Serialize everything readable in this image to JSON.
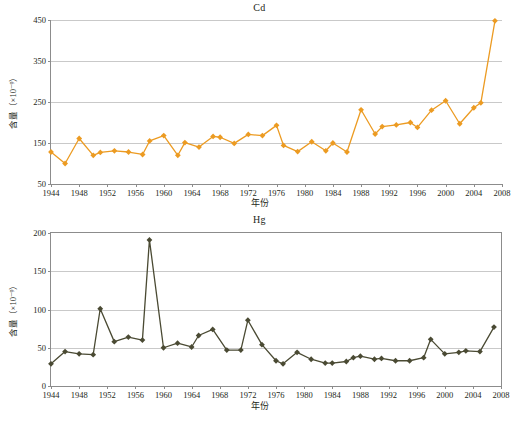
{
  "figure": {
    "panels": [
      "cd",
      "hg"
    ],
    "x_axis_title": "年份",
    "y_axis_title": "含量（×10⁻⁹）"
  },
  "chart_data": [
    {
      "type": "line",
      "title": "Cd",
      "xlabel": "年份",
      "ylabel": "含量（×10⁻⁹）",
      "xlim": [
        1944,
        2008
      ],
      "ylim": [
        50,
        450
      ],
      "xticks": [
        1944,
        1948,
        1952,
        1956,
        1960,
        1964,
        1968,
        1972,
        1976,
        1980,
        1984,
        1988,
        1992,
        1996,
        2000,
        2004,
        2008
      ],
      "yticks": [
        50,
        150,
        250,
        350,
        450
      ],
      "grid": true,
      "legend": "none",
      "color": "#EC9B22",
      "marker": "diamond",
      "x": [
        1944,
        1946,
        1948,
        1950,
        1952,
        1954,
        1956,
        1958,
        1960,
        1962,
        1964,
        1966,
        1968,
        1970,
        1972,
        1974,
        1976,
        1978,
        1980,
        1982,
        1984,
        1986,
        1988,
        1990,
        1992,
        1994,
        1996,
        1998,
        2000,
        2002,
        2004,
        2006
      ],
      "values": [
        128,
        100,
        161,
        120,
        127,
        131,
        128,
        155,
        168,
        120,
        151,
        140,
        166,
        164,
        149,
        171,
        168,
        193,
        144,
        129,
        153,
        140,
        150,
        128,
        231,
        172,
        190,
        194,
        200,
        188,
        230,
        253,
        197,
        236,
        248,
        448
      ],
      "series": [
        {
          "name": "Cd",
          "points": [
            {
              "year": 1944,
              "value": 128
            },
            {
              "year": 1946,
              "value": 100
            },
            {
              "year": 1948,
              "value": 161
            },
            {
              "year": 1950,
              "value": 120
            },
            {
              "year": 1951,
              "value": 127
            },
            {
              "year": 1953,
              "value": 131
            },
            {
              "year": 1955,
              "value": 128
            },
            {
              "year": 1957,
              "value": 122
            },
            {
              "year": 1958,
              "value": 155
            },
            {
              "year": 1960,
              "value": 168
            },
            {
              "year": 1962,
              "value": 120
            },
            {
              "year": 1963,
              "value": 151
            },
            {
              "year": 1965,
              "value": 140
            },
            {
              "year": 1967,
              "value": 166
            },
            {
              "year": 1968,
              "value": 164
            },
            {
              "year": 1970,
              "value": 149
            },
            {
              "year": 1972,
              "value": 171
            },
            {
              "year": 1974,
              "value": 168
            },
            {
              "year": 1976,
              "value": 193
            },
            {
              "year": 1977,
              "value": 144
            },
            {
              "year": 1979,
              "value": 129
            },
            {
              "year": 1981,
              "value": 153
            },
            {
              "year": 1983,
              "value": 131
            },
            {
              "year": 1984,
              "value": 150
            },
            {
              "year": 1986,
              "value": 128
            },
            {
              "year": 1988,
              "value": 231
            },
            {
              "year": 1990,
              "value": 172
            },
            {
              "year": 1991,
              "value": 190
            },
            {
              "year": 1993,
              "value": 194
            },
            {
              "year": 1995,
              "value": 200
            },
            {
              "year": 1996,
              "value": 188
            },
            {
              "year": 1998,
              "value": 230
            },
            {
              "year": 2000,
              "value": 253
            },
            {
              "year": 2002,
              "value": 197
            },
            {
              "year": 2004,
              "value": 236
            },
            {
              "year": 2005,
              "value": 248
            },
            {
              "year": 2007,
              "value": 448
            }
          ]
        }
      ]
    },
    {
      "type": "line",
      "title": "Hg",
      "xlabel": "年份",
      "ylabel": "含量（×10⁻⁹）",
      "xlim": [
        1944,
        2008
      ],
      "ylim": [
        0,
        200
      ],
      "xticks": [
        1944,
        1948,
        1952,
        1956,
        1960,
        1964,
        1968,
        1972,
        1976,
        1980,
        1984,
        1988,
        1992,
        1996,
        2000,
        2004,
        2008
      ],
      "yticks": [
        0,
        50,
        100,
        150,
        200
      ],
      "grid": true,
      "legend": "none",
      "color": "#4A4A33",
      "marker": "diamond",
      "x": [
        1944,
        1946,
        1948,
        1950,
        1952,
        1954,
        1956,
        1958,
        1960,
        1962,
        1964,
        1966,
        1968,
        1970,
        1972,
        1974,
        1976,
        1978,
        1980,
        1982,
        1984,
        1986,
        1988,
        1990,
        1992,
        1994,
        1996,
        1998,
        2000,
        2002,
        2004,
        2006
      ],
      "values": [
        29,
        45,
        42,
        41,
        101,
        58,
        64,
        60,
        191,
        50,
        56,
        51,
        66,
        74,
        47,
        47,
        86,
        54,
        33,
        29,
        44,
        35,
        30,
        30,
        32,
        37,
        39,
        35,
        36,
        33,
        33,
        37,
        61,
        42,
        44,
        46,
        45,
        77
      ],
      "series": [
        {
          "name": "Hg",
          "points": [
            {
              "year": 1944,
              "value": 29
            },
            {
              "year": 1946,
              "value": 45
            },
            {
              "year": 1948,
              "value": 42
            },
            {
              "year": 1950,
              "value": 41
            },
            {
              "year": 1951,
              "value": 101
            },
            {
              "year": 1953,
              "value": 58
            },
            {
              "year": 1955,
              "value": 64
            },
            {
              "year": 1957,
              "value": 60
            },
            {
              "year": 1958,
              "value": 191
            },
            {
              "year": 1960,
              "value": 50
            },
            {
              "year": 1962,
              "value": 56
            },
            {
              "year": 1964,
              "value": 51
            },
            {
              "year": 1965,
              "value": 66
            },
            {
              "year": 1967,
              "value": 74
            },
            {
              "year": 1969,
              "value": 47
            },
            {
              "year": 1971,
              "value": 47
            },
            {
              "year": 1972,
              "value": 86
            },
            {
              "year": 1974,
              "value": 54
            },
            {
              "year": 1976,
              "value": 33
            },
            {
              "year": 1977,
              "value": 29
            },
            {
              "year": 1979,
              "value": 44
            },
            {
              "year": 1981,
              "value": 35
            },
            {
              "year": 1983,
              "value": 30
            },
            {
              "year": 1984,
              "value": 30
            },
            {
              "year": 1986,
              "value": 32
            },
            {
              "year": 1987,
              "value": 37
            },
            {
              "year": 1988,
              "value": 39
            },
            {
              "year": 1990,
              "value": 35
            },
            {
              "year": 1991,
              "value": 36
            },
            {
              "year": 1993,
              "value": 33
            },
            {
              "year": 1995,
              "value": 33
            },
            {
              "year": 1997,
              "value": 37
            },
            {
              "year": 1998,
              "value": 61
            },
            {
              "year": 2000,
              "value": 42
            },
            {
              "year": 2002,
              "value": 44
            },
            {
              "year": 2003,
              "value": 46
            },
            {
              "year": 2005,
              "value": 45
            },
            {
              "year": 2007,
              "value": 77
            }
          ]
        }
      ]
    }
  ]
}
